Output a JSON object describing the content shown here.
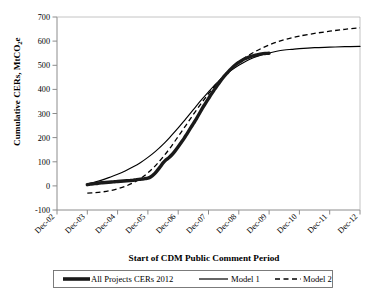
{
  "chart_data": {
    "type": "line",
    "title": "",
    "subtitle": "",
    "xlabel": "Start of CDM Public Comment Period",
    "ylabel": "Cumulative CERs, MtCO2e",
    "ylabel_parts": {
      "pre": "Cumulative CERs, MtCO",
      "sub": "2",
      "post": "e"
    },
    "xlim_labels": [
      "Dec-02",
      "Dec-12"
    ],
    "ylim": [
      -100,
      700
    ],
    "ytick_step": 100,
    "grid": false,
    "legend_position": "bottom",
    "xticks": [
      "Dec-02",
      "Dec-03",
      "Dec-04",
      "Dec-05",
      "Dec-06",
      "Dec-07",
      "Dec-08",
      "Dec-09",
      "Dec-10",
      "Dec-11",
      "Dec-12"
    ],
    "yticks": [
      "-100",
      "0",
      "100",
      "200",
      "300",
      "400",
      "500",
      "600",
      "700"
    ],
    "x_index_range": [
      0,
      10
    ],
    "series": [
      {
        "name": "All Projects CERs 2012",
        "style": "thick-solid",
        "color": "#1a1a1a",
        "x": [
          1.0,
          1.1,
          1.2,
          1.3,
          1.4,
          1.5,
          1.6,
          1.7,
          1.8,
          1.9,
          2.0,
          2.1,
          2.2,
          2.3,
          2.4,
          2.5,
          2.6,
          2.7,
          2.8,
          2.9,
          3.0,
          3.1,
          3.2,
          3.3,
          3.4,
          3.5,
          3.6,
          3.7,
          3.8,
          3.9,
          4.0,
          4.1,
          4.2,
          4.3,
          4.4,
          4.5,
          4.6,
          4.7,
          4.8,
          4.9,
          5.0,
          5.1,
          5.2,
          5.3,
          5.4,
          5.5,
          5.6,
          5.7,
          5.8,
          5.9,
          6.0,
          6.1,
          6.2,
          6.3,
          6.4,
          6.5,
          6.6,
          6.7,
          6.8,
          6.9,
          7.0
        ],
        "y": [
          5,
          7,
          9,
          10,
          12,
          13,
          14,
          15,
          16,
          17,
          18,
          19,
          20,
          21,
          22,
          23,
          25,
          27,
          28,
          30,
          32,
          38,
          48,
          62,
          78,
          95,
          108,
          118,
          130,
          145,
          162,
          180,
          198,
          218,
          238,
          258,
          278,
          300,
          322,
          342,
          362,
          382,
          400,
          418,
          435,
          452,
          466,
          480,
          492,
          503,
          512,
          520,
          527,
          532,
          537,
          540,
          543,
          546,
          548,
          549,
          550
        ]
      },
      {
        "name": "Model 1",
        "style": "thin-solid",
        "color": "#000000",
        "asymptote": 578,
        "x": [
          1.0,
          1.25,
          1.5,
          1.75,
          2.0,
          2.25,
          2.5,
          2.75,
          3.0,
          3.25,
          3.5,
          3.75,
          4.0,
          4.25,
          4.5,
          4.75,
          5.0,
          5.25,
          5.5,
          5.75,
          6.0,
          6.25,
          6.5,
          6.75,
          7.0,
          7.25,
          7.5,
          7.75,
          8.0,
          8.5,
          9.0,
          9.5,
          10.0
        ],
        "y": [
          8,
          16,
          25,
          36,
          48,
          62,
          78,
          96,
          118,
          143,
          172,
          205,
          240,
          278,
          316,
          354,
          390,
          424,
          453,
          479,
          500,
          518,
          532,
          543,
          551,
          558,
          563,
          566,
          569,
          573,
          575,
          577,
          578
        ]
      },
      {
        "name": "Model 2",
        "style": "dashed",
        "color": "#000000",
        "asymptote": 655,
        "x": [
          1.0,
          1.25,
          1.5,
          1.75,
          2.0,
          2.25,
          2.5,
          2.75,
          3.0,
          3.25,
          3.5,
          3.75,
          4.0,
          4.25,
          4.5,
          4.75,
          5.0,
          5.25,
          5.5,
          5.75,
          6.0,
          6.25,
          6.5,
          6.75,
          7.0,
          7.25,
          7.5,
          7.75,
          8.0,
          8.5,
          9.0,
          9.5,
          10.0
        ],
        "y": [
          -30,
          -28,
          -25,
          -20,
          -12,
          -2,
          12,
          30,
          54,
          84,
          120,
          160,
          205,
          250,
          296,
          340,
          382,
          420,
          455,
          486,
          512,
          535,
          554,
          570,
          584,
          596,
          606,
          614,
          621,
          632,
          641,
          649,
          655
        ]
      }
    ]
  },
  "legend": {
    "items": [
      {
        "label": "All Projects CERs 2012",
        "marker": "thick-solid-swatch"
      },
      {
        "label": "Model 1",
        "marker": "thin-solid-swatch"
      },
      {
        "label": "Model 2",
        "marker": "dashed-swatch"
      }
    ]
  },
  "colors": {
    "data_line": "#1a1a1a",
    "model_line": "#000000",
    "axis": "#8c8c8c",
    "text": "#000000",
    "background": "#ffffff"
  }
}
